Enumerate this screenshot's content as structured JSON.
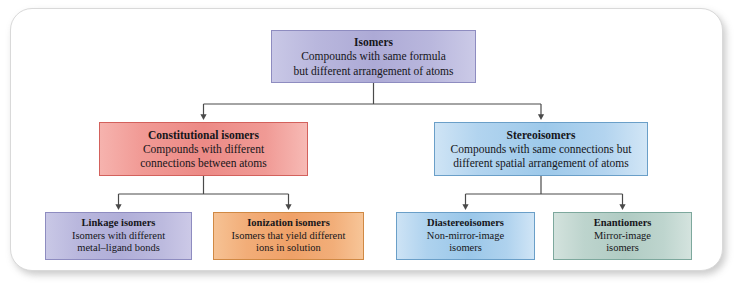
{
  "diagram": {
    "colors": {
      "violet": "#b0aed8",
      "red": "#ec8a86",
      "blue": "#9dc9ea",
      "orange": "#efa168",
      "green": "#b0cbc3",
      "connector": "#4a4a4a",
      "frame_border": "#d9d9d9"
    },
    "nodes": {
      "isomers": {
        "title": "Isomers",
        "desc_line1": "Compounds with same formula",
        "desc_line2": "but different arrangement of atoms"
      },
      "constitutional": {
        "title": "Constitutional isomers",
        "desc_line1": "Compounds with different",
        "desc_line2": "connections between atoms"
      },
      "stereoisomers": {
        "title": "Stereoisomers",
        "desc_line1": "Compounds with same connections but",
        "desc_line2": "different spatial arrangement of atoms"
      },
      "linkage": {
        "title": "Linkage isomers",
        "desc_line1": "Isomers with different",
        "desc_line2": "metal–ligand bonds"
      },
      "ionization": {
        "title": "Ionization isomers",
        "desc_line1": "Isomers that yield different",
        "desc_line2": "ions in solution"
      },
      "diastereoisomers": {
        "title": "Diastereoisomers",
        "desc_line1": "Non-mirror-image",
        "desc_line2": "isomers"
      },
      "enantiomers": {
        "title": "Enantiomers",
        "desc_line1": "Mirror-image",
        "desc_line2": "isomers"
      }
    }
  }
}
